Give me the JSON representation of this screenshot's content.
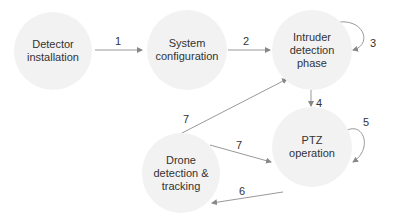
{
  "nodes": [
    {
      "id": "detector",
      "label": "Detector installation"
    },
    {
      "id": "system",
      "label": "System configuration"
    },
    {
      "id": "intruder",
      "label": "Intruder detection phase"
    },
    {
      "id": "ptz",
      "label": "PTZ operation"
    },
    {
      "id": "drone",
      "label": "Drone detection & tracking"
    }
  ],
  "edges": [
    {
      "from": "detector",
      "to": "system",
      "label": "1"
    },
    {
      "from": "system",
      "to": "intruder",
      "label": "2"
    },
    {
      "from": "intruder",
      "to": "intruder",
      "label": "3"
    },
    {
      "from": "intruder",
      "to": "ptz",
      "label": "4"
    },
    {
      "from": "ptz",
      "to": "ptz",
      "label": "5"
    },
    {
      "from": "ptz",
      "to": "drone",
      "label": "6"
    },
    {
      "from": "drone",
      "to": "intruder",
      "label": "7"
    },
    {
      "from": "drone",
      "to": "ptz",
      "label": "7"
    }
  ]
}
